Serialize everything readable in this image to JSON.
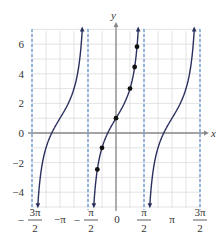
{
  "chart_data": {
    "type": "line",
    "title": "",
    "function": "y = 1 + 2 tan x",
    "xlabel": "x",
    "ylabel": "y",
    "xlim": [
      -4.712,
      4.712
    ],
    "ylim": [
      -5,
      7
    ],
    "grid": true,
    "y_ticks": [
      -4,
      -2,
      0,
      2,
      4,
      6
    ],
    "y_tick_labels": [
      "−4",
      "−2",
      "0",
      "2",
      "4",
      "6"
    ],
    "x_ticks": [
      -4.712,
      -3.1416,
      -1.5708,
      0,
      1.5708,
      3.1416,
      4.712
    ],
    "x_tick_labels": [
      {
        "num": "3π",
        "den": "2",
        "sign": "−"
      },
      {
        "text": "−π"
      },
      {
        "num": "π",
        "den": "2",
        "sign": "−"
      },
      {
        "text": "0"
      },
      {
        "num": "π",
        "den": "2",
        "sign": ""
      },
      {
        "text": "π"
      },
      {
        "num": "3π",
        "den": "2",
        "sign": ""
      }
    ],
    "asymptotes_x": [
      -4.712,
      -1.5708,
      1.5708,
      4.712
    ],
    "branches": [
      {
        "x_center": -3.1416
      },
      {
        "x_center": 0
      },
      {
        "x_center": 3.1416
      }
    ],
    "points": [
      {
        "x": -1.0472,
        "y": -2.46
      },
      {
        "x": -0.7854,
        "y": -1.0
      },
      {
        "x": 0,
        "y": 1.0
      },
      {
        "x": 0.7854,
        "y": 3.0
      },
      {
        "x": 1.0472,
        "y": 4.46
      },
      {
        "x": 1.1781,
        "y": 5.83
      }
    ],
    "colors": {
      "curve": "#2b2f5e",
      "asymptote": "#4a86c8",
      "grid": "#dcdcdc",
      "axis": "#888888"
    }
  }
}
